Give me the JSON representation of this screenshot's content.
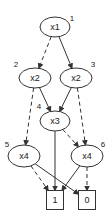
{
  "diagram": {
    "type": "binary-decision-diagram",
    "nodes": [
      {
        "id": "n1",
        "number": "1",
        "label": "x1",
        "kind": "decision"
      },
      {
        "id": "n2",
        "number": "2",
        "label": "x2",
        "kind": "decision"
      },
      {
        "id": "n3",
        "number": "3",
        "label": "x2",
        "kind": "decision"
      },
      {
        "id": "n4",
        "number": "4",
        "label": "x3",
        "kind": "decision"
      },
      {
        "id": "n5",
        "number": "5",
        "label": "x4",
        "kind": "decision"
      },
      {
        "id": "n6",
        "number": "6",
        "label": "x4",
        "kind": "decision"
      },
      {
        "id": "t1",
        "number": "",
        "label": "1",
        "kind": "terminal"
      },
      {
        "id": "t0",
        "number": "",
        "label": "0",
        "kind": "terminal"
      }
    ],
    "edges": [
      {
        "from": "n1",
        "to": "n2",
        "style": "dashed"
      },
      {
        "from": "n1",
        "to": "n3",
        "style": "solid"
      },
      {
        "from": "n2",
        "to": "n4",
        "style": "solid"
      },
      {
        "from": "n2",
        "to": "n5",
        "style": "dashed"
      },
      {
        "from": "n3",
        "to": "n4",
        "style": "solid"
      },
      {
        "from": "n3",
        "to": "n6",
        "style": "dashed"
      },
      {
        "from": "n4",
        "to": "t1",
        "style": "solid"
      },
      {
        "from": "n4",
        "to": "n6",
        "style": "dashed"
      },
      {
        "from": "n5",
        "to": "t0",
        "style": "solid"
      },
      {
        "from": "n5",
        "to": "t1",
        "style": "dashed"
      },
      {
        "from": "n6",
        "to": "t1",
        "style": "solid"
      },
      {
        "from": "n6",
        "to": "t0",
        "style": "dashed"
      }
    ]
  }
}
